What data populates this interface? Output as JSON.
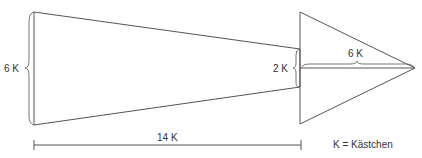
{
  "diagram": {
    "title": "",
    "shapes": {
      "shaft": {
        "type": "trapezoid",
        "label": "arrow-shaft"
      },
      "head": {
        "type": "triangle",
        "label": "arrow-head"
      }
    },
    "dimensions": {
      "shaft_height": "6 K",
      "shaft_end_height": "2 K",
      "head_length": "6 K",
      "shaft_length": "14 K"
    },
    "legend": "K = Kästchen",
    "colors": {
      "line": "#555555",
      "text": "#333333",
      "background": "#ffffff"
    }
  }
}
